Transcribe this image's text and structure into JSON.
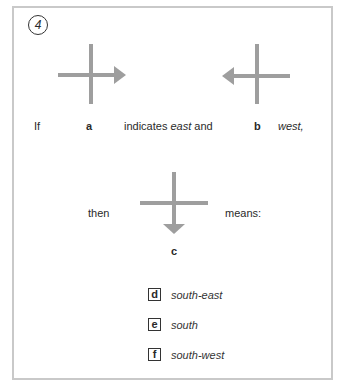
{
  "exercise": {
    "number": "4",
    "row1": {
      "if_text": "If",
      "label_a": "a",
      "indicates_text": "indicates ",
      "east_text": "east",
      "and_text": " and",
      "label_b": "b",
      "west_text": "west,"
    },
    "row2": {
      "then_text": "then",
      "means_text": "means:",
      "label_c": "c"
    },
    "options": [
      {
        "letter": "d",
        "text": "south-east"
      },
      {
        "letter": "e",
        "text": "south"
      },
      {
        "letter": "f",
        "text": "south-west"
      }
    ],
    "colors": {
      "arrow": "#9e9e9e",
      "border": "#c9c9c9"
    }
  }
}
